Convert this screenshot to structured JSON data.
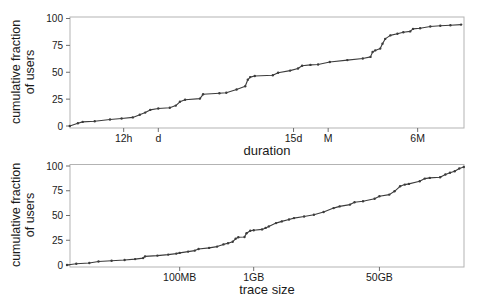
{
  "figure": {
    "background_color": "#ffffff",
    "line_color": "#3c3c3c",
    "frame_color": "#b3b3b3",
    "tick_color": "#6e6e6e",
    "text_color": "#1a1a1a"
  },
  "chart_data": [
    {
      "type": "line",
      "subtype": "cdf",
      "title": "",
      "xlabel": "duration",
      "ylabel": "cumulative fraction of users",
      "ylabel_lines": [
        "cumulative fraction",
        "of users"
      ],
      "x_scale": "log",
      "x_unit": "days",
      "xlim": [
        0.17,
        450
      ],
      "ylim": [
        0,
        100
      ],
      "y_ticks": [
        "0",
        "25",
        "50",
        "75",
        "100"
      ],
      "y_tick_values": [
        0,
        25,
        50,
        75,
        100
      ],
      "x_ticks": [
        {
          "label": "12h",
          "value": 0.5
        },
        {
          "label": "d",
          "value": 1
        },
        {
          "label": "15d",
          "value": 15
        },
        {
          "label": "M",
          "value": 30
        },
        {
          "label": "6M",
          "value": 180
        }
      ],
      "grid": false,
      "legend": "none",
      "points": [
        [
          0.17,
          0
        ],
        [
          0.2,
          2.5
        ],
        [
          0.22,
          3.8
        ],
        [
          0.28,
          4.5
        ],
        [
          0.38,
          6
        ],
        [
          0.48,
          7
        ],
        [
          0.6,
          8
        ],
        [
          0.69,
          10.5
        ],
        [
          0.77,
          12.5
        ],
        [
          0.85,
          15
        ],
        [
          1.0,
          16.3
        ],
        [
          1.26,
          17
        ],
        [
          1.42,
          19
        ],
        [
          1.54,
          22.5
        ],
        [
          1.71,
          24.5
        ],
        [
          2.3,
          25.5
        ],
        [
          2.45,
          29.5
        ],
        [
          3.4,
          30.5
        ],
        [
          3.9,
          31
        ],
        [
          4.8,
          34
        ],
        [
          5.7,
          37
        ],
        [
          6.0,
          43
        ],
        [
          6.3,
          45.5
        ],
        [
          6.9,
          46.5
        ],
        [
          9.9,
          47.2
        ],
        [
          11,
          49.5
        ],
        [
          14,
          51.5
        ],
        [
          16.4,
          53.5
        ],
        [
          17.8,
          56
        ],
        [
          21,
          56.8
        ],
        [
          24.5,
          57.2
        ],
        [
          31,
          59.5
        ],
        [
          44,
          61.3
        ],
        [
          60,
          62.8
        ],
        [
          70,
          64.3
        ],
        [
          73,
          68.8
        ],
        [
          77,
          70.3
        ],
        [
          85,
          72
        ],
        [
          89,
          76.5
        ],
        [
          94,
          81
        ],
        [
          104,
          84.3
        ],
        [
          120,
          85.8
        ],
        [
          135,
          87.3
        ],
        [
          155,
          88
        ],
        [
          164,
          90.3
        ],
        [
          189,
          91
        ],
        [
          232,
          92.6
        ],
        [
          283,
          93.2
        ],
        [
          347,
          93.7
        ],
        [
          430,
          94.3
        ]
      ]
    },
    {
      "type": "line",
      "subtype": "cdf",
      "title": "",
      "xlabel": "trace size",
      "ylabel": "cumulative fraction of users",
      "ylabel_lines": [
        "cumulative fraction",
        "of users"
      ],
      "x_scale": "log",
      "x_unit": "GB",
      "xlim": [
        0.003,
        700
      ],
      "ylim": [
        0,
        100
      ],
      "y_ticks": [
        "0",
        "25",
        "50",
        "75",
        "100"
      ],
      "y_tick_values": [
        0,
        25,
        50,
        75,
        100
      ],
      "x_ticks": [
        {
          "label": "100MB",
          "value": 0.1
        },
        {
          "label": "1GB",
          "value": 1
        },
        {
          "label": "50GB",
          "value": 50
        }
      ],
      "grid": false,
      "legend": "none",
      "points": [
        [
          0.003,
          0
        ],
        [
          0.004,
          1.3
        ],
        [
          0.006,
          2
        ],
        [
          0.008,
          3.5
        ],
        [
          0.012,
          4.2
        ],
        [
          0.018,
          5
        ],
        [
          0.025,
          6
        ],
        [
          0.032,
          7
        ],
        [
          0.034,
          8.7
        ],
        [
          0.05,
          9.5
        ],
        [
          0.07,
          10.5
        ],
        [
          0.09,
          11.5
        ],
        [
          0.1,
          12.2
        ],
        [
          0.13,
          13.5
        ],
        [
          0.16,
          14.5
        ],
        [
          0.18,
          16.2
        ],
        [
          0.25,
          17.3
        ],
        [
          0.32,
          18.6
        ],
        [
          0.39,
          20.8
        ],
        [
          0.45,
          22
        ],
        [
          0.52,
          23.5
        ],
        [
          0.57,
          26.5
        ],
        [
          0.62,
          28
        ],
        [
          0.75,
          28.3
        ],
        [
          0.8,
          32
        ],
        [
          0.9,
          34.5
        ],
        [
          1.0,
          35.2
        ],
        [
          1.3,
          36
        ],
        [
          1.45,
          37.5
        ],
        [
          1.6,
          39
        ],
        [
          2.0,
          42.3
        ],
        [
          2.4,
          44
        ],
        [
          3.0,
          46
        ],
        [
          3.5,
          47.4
        ],
        [
          4.8,
          49
        ],
        [
          6.5,
          50.8
        ],
        [
          8.8,
          53.5
        ],
        [
          12,
          57.5
        ],
        [
          14.5,
          59.2
        ],
        [
          20,
          61
        ],
        [
          23,
          63.3
        ],
        [
          30,
          64.3
        ],
        [
          43,
          67
        ],
        [
          50,
          69.5
        ],
        [
          68,
          71.1
        ],
        [
          80,
          74.4
        ],
        [
          95,
          79.5
        ],
        [
          110,
          81.2
        ],
        [
          125,
          81.9
        ],
        [
          175,
          84.6
        ],
        [
          205,
          87.3
        ],
        [
          240,
          88
        ],
        [
          330,
          88.6
        ],
        [
          390,
          91.4
        ],
        [
          450,
          93.1
        ],
        [
          520,
          94.7
        ],
        [
          600,
          97.5
        ],
        [
          690,
          99
        ]
      ]
    }
  ]
}
